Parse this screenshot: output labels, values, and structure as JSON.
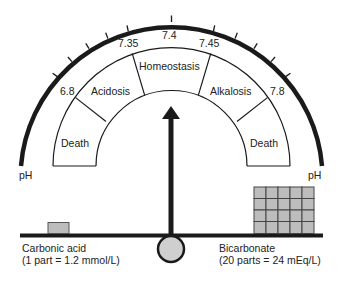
{
  "diagram": {
    "axis_label_left": "pH",
    "axis_label_right": "pH",
    "scale_values": [
      "6.8",
      "7.35",
      "7.4",
      "7.45",
      "7.8"
    ],
    "zones": [
      {
        "label": "Death",
        "position": "left"
      },
      {
        "label": "Acidosis",
        "position": "left-middle"
      },
      {
        "label": "Homeostasis",
        "position": "center"
      },
      {
        "label": "Alkalosis",
        "position": "right-middle"
      },
      {
        "label": "Death",
        "position": "right"
      }
    ],
    "left_side": {
      "name": "Carbonic acid",
      "detail": "(1 part = 1.2 mmol/L)",
      "parts": 1
    },
    "right_side": {
      "name": "Bicarbonate",
      "detail": "(20 parts = 24 mEq/L)",
      "parts": 20,
      "grid_columns": 5,
      "grid_rows": 4
    },
    "pointer_value": "7.4",
    "colors": {
      "ink": "#1a1a1a",
      "block_fill": "#bdbdbd",
      "fulcrum_fill": "#cfcfcf"
    }
  }
}
